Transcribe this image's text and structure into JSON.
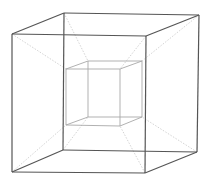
{
  "diagram": {
    "type": "tesseract",
    "colors": {
      "background": "#ffffff",
      "outer_edges": "#555555",
      "inner_edges": "#a8a8a8",
      "connecting_edges": "#c8c8c8"
    },
    "outer_cube": {
      "front": {
        "tl": [
          12,
          34
        ],
        "tr": [
          146,
          36
        ],
        "br": [
          145,
          173
        ],
        "bl": [
          12,
          172
        ]
      },
      "back": {
        "tl": [
          64,
          13
        ],
        "tr": [
          199,
          15
        ],
        "br": [
          197,
          152
        ],
        "bl": [
          63,
          150
        ]
      }
    },
    "inner_cube": {
      "front": {
        "tl": [
          66,
          69
        ],
        "tr": [
          120,
          69
        ],
        "br": [
          120,
          126
        ],
        "bl": [
          66,
          125
        ]
      },
      "back": {
        "tl": [
          88,
          61
        ],
        "tr": [
          142,
          61
        ],
        "br": [
          142,
          117
        ],
        "bl": [
          88,
          117
        ]
      }
    }
  }
}
